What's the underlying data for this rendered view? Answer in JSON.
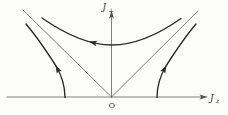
{
  "figure": {
    "background_color": "#fcfcfa",
    "axis_color": "#5f5f5f",
    "trajectory_color": "#2b2b2b",
    "labels": {
      "vertical_axis": {
        "symbol": "J",
        "subscript": "⊥"
      },
      "horizontal_axis": {
        "symbol": "J",
        "subscript": "z"
      },
      "origin": "O"
    },
    "geometry": {
      "h_axis": "M 7,97 L 202,97",
      "v_axis": "M 111.5,97 L 111.5,16",
      "left_separatrix": "M 111.5,97 L 23,10",
      "right_separatrix": "M 111.5,97 L 198,11",
      "hyperbola": "M 42,18 C 70,37.5 92,45 112,45 C 132,45 154,37.5 181,18.5",
      "left_trajectory": "M 65,97.5 C 65,85 62,76 56,66 C 48,53.5 38,38 26,24",
      "right_trajectory": "M 157,97.5 C 157,85 160,76 166,66 C 174,53.5 184,38 196,24"
    },
    "arrows": {
      "h_axis": {
        "transform": "translate(203.5,97) rotate(0)"
      },
      "v_axis": {
        "transform": "translate(111.5,14.5) rotate(-90)"
      },
      "hyperbola": {
        "transform": "translate(93,42.6) rotate(193)"
      },
      "left_trajectory": {
        "transform": "translate(57.5,69) rotate(-117)"
      },
      "right_trajectory": {
        "transform": "translate(164.5,69) rotate(-63)"
      }
    }
  }
}
